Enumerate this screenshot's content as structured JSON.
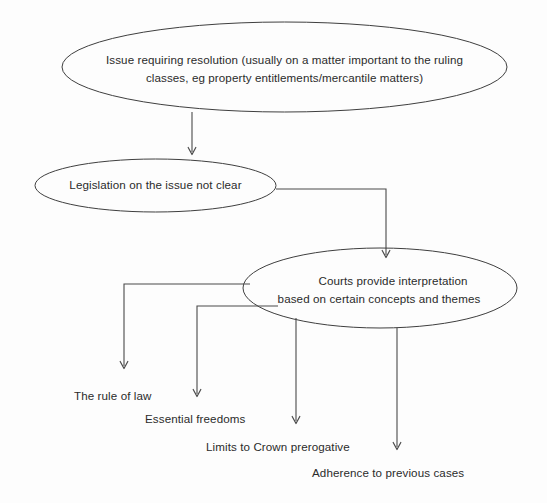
{
  "diagram": {
    "background_color": "#fdfdfd",
    "stroke_color": "#3f3f3f",
    "text_color": "#2b2b2b",
    "nodes": [
      {
        "id": "issue",
        "shape": "ellipse",
        "lines": [
          "Issue requiring resolution (usually on a matter important to the ruling",
          "classes, eg property entitlements/mercantile matters)"
        ]
      },
      {
        "id": "legislation",
        "shape": "ellipse",
        "lines": [
          "Legislation on the issue not clear"
        ]
      },
      {
        "id": "courts",
        "shape": "ellipse",
        "lines": [
          "Courts provide interpretation",
          "based on certain concepts and themes"
        ]
      }
    ],
    "leaves": [
      {
        "id": "rule-of-law",
        "label": "The rule of law"
      },
      {
        "id": "essential-freedoms",
        "label": "Essential freedoms"
      },
      {
        "id": "crown-prerogative",
        "label": "Limits to Crown prerogative"
      },
      {
        "id": "previous-cases",
        "label": "Adherence to previous cases"
      }
    ]
  }
}
